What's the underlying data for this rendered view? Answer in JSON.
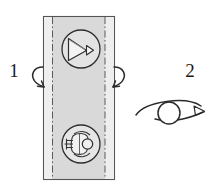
{
  "diagram": {
    "background_color": "#ffffff",
    "line_color": "#3a3a3a",
    "strip": {
      "name": "vertical-film-strip",
      "fill_color": "#d9d9d9",
      "border_color": "#555555",
      "x": 43,
      "y": 16,
      "width": 71,
      "height": 164,
      "dashed_guide_color": "#666666",
      "dashed_guide_left_x": 52,
      "dashed_guide_right_x": 105
    },
    "icons": [
      {
        "name": "projector-beam-icon",
        "position": "top",
        "cx": 81,
        "cy": 49,
        "r": 19,
        "description": "cone beam with small triangle"
      },
      {
        "name": "figure-icon",
        "position": "bottom",
        "cx": 81,
        "cy": 144,
        "r": 19,
        "description": "stylized figure with round head"
      }
    ],
    "steps": [
      {
        "name": "step-1",
        "label": "1",
        "label_x": 14,
        "label_y": 77,
        "annotation": "flip-around-vertical-axis",
        "arrows": [
          {
            "name": "flip-arrow-left",
            "side": "left"
          },
          {
            "name": "flip-arrow-right",
            "side": "right"
          }
        ]
      },
      {
        "name": "step-2",
        "label": "2",
        "label_x": 190,
        "label_y": 77,
        "annotation": "rotate-arc-over-circle",
        "arrows": [
          {
            "name": "rotate-arc-arrow",
            "side": "right"
          }
        ],
        "pivot_circle": {
          "cx": 169,
          "cy": 113,
          "r": 11
        }
      }
    ]
  }
}
